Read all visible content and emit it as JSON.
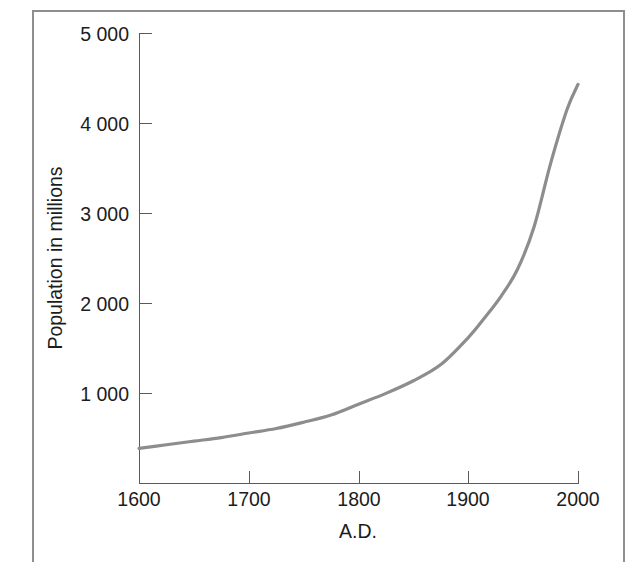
{
  "figure": {
    "background_color": "#ffffff",
    "frame_color": "#8e8e8e",
    "axis_color": "#5a5a5a",
    "curve_color": "#8d8d8d",
    "text_color": "#1c1c1c"
  },
  "chart_data": {
    "type": "line",
    "title": "",
    "subtitle": "",
    "xlabel": "A.D.",
    "ylabel": "Population in millions",
    "xlim": [
      1600,
      2000
    ],
    "ylim": [
      0,
      5000
    ],
    "grid": false,
    "legend": null,
    "x_tick_labels": [
      "1600",
      "1700",
      "1800",
      "1900",
      "2000"
    ],
    "x_ticks": [
      1600,
      1700,
      1800,
      1900,
      2000
    ],
    "y_tick_labels": [
      "1 000",
      "2 000",
      "3 000",
      "4 000",
      "5 000"
    ],
    "y_ticks": [
      1000,
      2000,
      3000,
      4000,
      5000
    ],
    "series": [
      {
        "name": "World population",
        "color": "#8d8d8d",
        "x": [
          1600,
          1625,
          1650,
          1675,
          1700,
          1725,
          1750,
          1775,
          1800,
          1825,
          1850,
          1875,
          1900,
          1915,
          1930,
          1945,
          1960,
          1975,
          1990,
          2000
        ],
        "values": [
          390,
          430,
          470,
          510,
          560,
          610,
          680,
          760,
          880,
          1000,
          1140,
          1320,
          1620,
          1840,
          2080,
          2380,
          2850,
          3550,
          4150,
          4430
        ]
      }
    ],
    "annotations": []
  }
}
